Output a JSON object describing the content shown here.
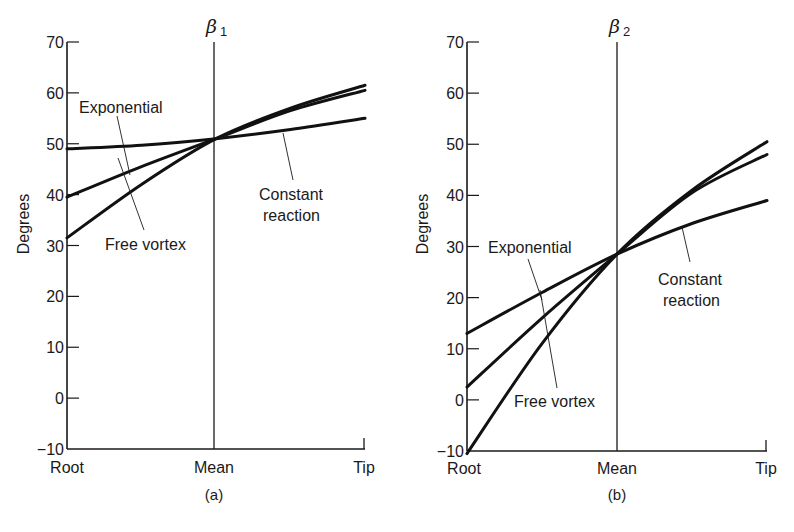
{
  "figure": {
    "panels_caption": [
      "(a)",
      "(b)"
    ]
  },
  "chart_data": [
    {
      "type": "line",
      "panel": "(a)",
      "title": "β1",
      "title_symbol": "β",
      "title_subscript": "1",
      "xlabel": "",
      "ylabel": "Degrees",
      "categories": [
        "Root",
        "Mean",
        "Tip"
      ],
      "ylim": [
        -10,
        70
      ],
      "yticks": [
        70,
        60,
        50,
        40,
        30,
        20,
        10,
        0,
        -10
      ],
      "grid": false,
      "x": [
        0,
        0.25,
        0.5,
        0.75,
        1.0
      ],
      "series": [
        {
          "name": "Free vortex",
          "values": [
            31.5,
            42.0,
            51.0,
            57.0,
            61.5
          ]
        },
        {
          "name": "Exponential",
          "values": [
            39.5,
            45.5,
            51.0,
            56.5,
            60.5
          ]
        },
        {
          "name": "Constant reaction",
          "values": [
            49.0,
            49.7,
            51.0,
            52.8,
            55.0
          ]
        }
      ],
      "annotations": [
        {
          "text": "Exponential",
          "points_to": "Exponential"
        },
        {
          "text": "Free vortex",
          "points_to": "Free vortex"
        },
        {
          "text": "Constant reaction",
          "points_to": "Constant reaction"
        }
      ],
      "caption": "(a)"
    },
    {
      "type": "line",
      "panel": "(b)",
      "title": "β2",
      "title_symbol": "β",
      "title_subscript": "2",
      "xlabel": "",
      "ylabel": "Degrees",
      "categories": [
        "Root",
        "Mean",
        "Tip"
      ],
      "ylim": [
        -10,
        70
      ],
      "yticks": [
        70,
        60,
        50,
        40,
        30,
        20,
        10,
        0,
        -10
      ],
      "grid": false,
      "x": [
        0,
        0.25,
        0.5,
        0.75,
        1.0
      ],
      "series": [
        {
          "name": "Free vortex",
          "values": [
            -10.5,
            11.0,
            28.5,
            41.0,
            50.5
          ]
        },
        {
          "name": "Exponential",
          "values": [
            2.5,
            16.0,
            28.5,
            40.5,
            48.0
          ]
        },
        {
          "name": "Constant reaction",
          "values": [
            13.0,
            21.0,
            28.5,
            34.5,
            39.0
          ]
        }
      ],
      "annotations": [
        {
          "text": "Exponential",
          "points_to": "Exponential"
        },
        {
          "text": "Free vortex",
          "points_to": "Free vortex"
        },
        {
          "text": "Constant reaction",
          "points_to": "Constant reaction"
        }
      ],
      "caption": "(b)"
    }
  ],
  "labels": {
    "a": {
      "beta_symbol": "β",
      "beta_sub": "1",
      "ylabel": "Degrees",
      "exponential": "Exponential",
      "free_vortex": "Free vortex",
      "constant_1": "Constant",
      "constant_2": "reaction",
      "root": "Root",
      "mean": "Mean",
      "tip": "Tip",
      "caption": "(a)",
      "ticks": [
        "70",
        "60",
        "50",
        "40",
        "30",
        "20",
        "10",
        "0",
        "−10"
      ]
    },
    "b": {
      "beta_symbol": "β",
      "beta_sub": "2",
      "ylabel": "Degrees",
      "exponential": "Exponential",
      "free_vortex": "Free vortex",
      "constant_1": "Constant",
      "constant_2": "reaction",
      "root": "Root",
      "mean": "Mean",
      "tip": "Tip",
      "caption": "(b)",
      "ticks": [
        "70",
        "60",
        "50",
        "40",
        "30",
        "20",
        "10",
        "0",
        "−10"
      ]
    }
  }
}
